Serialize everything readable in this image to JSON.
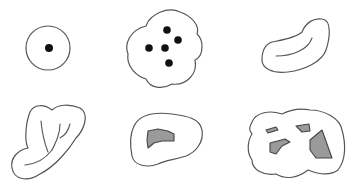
{
  "diagram": {
    "layout": {
      "rows": 2,
      "columns": 3
    },
    "colors": {
      "outline": "#555555",
      "dot": "#111111",
      "hole_fill": "#9a9a9a",
      "background": "#ffffff"
    },
    "panels": [
      {
        "id": "circle-single-dot",
        "description": "Circle with one central dot",
        "dots": 1
      },
      {
        "id": "lobed-blob-five-dots",
        "description": "Lobed blob with five dots",
        "dots": 5
      },
      {
        "id": "curved-tube",
        "description": "Curved kidney-shaped tube with inner fold line",
        "dots": 0
      },
      {
        "id": "twisted-tube",
        "description": "Twisted folded shape with branching inner lines",
        "dots": 0
      },
      {
        "id": "annulus-one-hole",
        "description": "Blob with one gray shaded hole",
        "holes": 1
      },
      {
        "id": "blob-multiple-holes",
        "description": "Lobed blob with four gray shaded holes",
        "holes": 4
      }
    ]
  }
}
